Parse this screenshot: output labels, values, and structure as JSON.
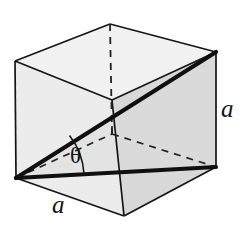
{
  "figure": {
    "kind": "geometry-diagram",
    "background_color": "#ffffff"
  },
  "labels": {
    "edge_bottom": "a",
    "edge_right": "a",
    "angle": "θ"
  },
  "colors": {
    "stroke": "#151515",
    "bold_stroke": "#111111",
    "face_top": "#f2f2f2",
    "face_left": "#ededed",
    "face_front_upper": "#fafafa",
    "face_front_lower": "#e2e2e2",
    "face_right": "#d9d9d9",
    "face_bottom": "#ebebeb",
    "hidden_dash": "#262626"
  },
  "geometry": {
    "projection": "oblique",
    "vertices": {
      "front_bottom_left": [
        16,
        178
      ],
      "front_bottom_right": [
        124,
        216
      ],
      "front_top_left": [
        15,
        61
      ],
      "front_top_mid": [
        110,
        24
      ],
      "right_bottom_front": [
        216,
        167
      ],
      "right_top_back": [
        216,
        52
      ],
      "hidden_back_bottom": [
        112,
        134
      ],
      "front_mid_vertical_top": [
        112,
        100
      ]
    },
    "bold_edges": [
      {
        "name": "space-diagonal",
        "from": [
          16,
          178
        ],
        "to": [
          216,
          52
        ]
      },
      {
        "name": "base-diagonal",
        "from": [
          16,
          178
        ],
        "to": [
          216,
          167
        ]
      }
    ],
    "dashed_edges": [
      {
        "name": "hidden-vertical",
        "from": [
          110,
          24
        ],
        "to": [
          112,
          134
        ]
      },
      {
        "name": "hidden-depth-left",
        "from": [
          16,
          178
        ],
        "to": [
          112,
          134
        ]
      },
      {
        "name": "hidden-depth-right",
        "from": [
          112,
          134
        ],
        "to": [
          216,
          167
        ]
      }
    ],
    "angle_arc": {
      "vertex": [
        16,
        178
      ],
      "radius": 68,
      "between": [
        "base-diagonal",
        "space-diagonal"
      ],
      "label": "θ"
    }
  }
}
